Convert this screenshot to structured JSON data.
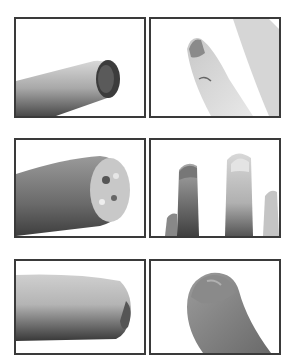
{
  "figure": {
    "layout": {
      "rows": 3,
      "columns": 2
    },
    "border_color": "#3a3a3a",
    "background": "#ffffff",
    "panels": [
      {
        "id": "p1",
        "row": 1,
        "col": 1,
        "description": "Fingertip with darkened, necrotic distal end, viewed from side"
      },
      {
        "id": "p2",
        "row": 1,
        "col": 2,
        "description": "Finger with damaged nail tip and small lesion, adjacent finger on right"
      },
      {
        "id": "p3",
        "row": 2,
        "col": 1,
        "description": "Close-up of fingertip with crusted, textured wound at tip"
      },
      {
        "id": "p4",
        "row": 2,
        "col": 2,
        "description": "Injured fingertip beside healthy finger with intact nail"
      },
      {
        "id": "p5",
        "row": 3,
        "col": 1,
        "description": "Finger with healed, slightly irregular tip, side view"
      },
      {
        "id": "p6",
        "row": 3,
        "col": 2,
        "description": "Healed fingertip with regrown nail"
      }
    ]
  }
}
